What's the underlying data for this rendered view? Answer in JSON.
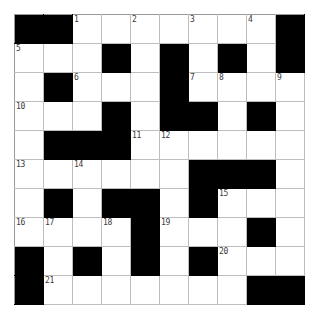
{
  "puzzle": {
    "type": "crossword-grid",
    "rows": 10,
    "columns": 10,
    "cell_size_px": 29,
    "colors": {
      "block": "#000000",
      "cell": "#ffffff",
      "gridline": "#bdbdbd",
      "border": "#8a8a8a",
      "number_text": "#3a3a3a",
      "page_background": "#ffffff"
    },
    "numbered_clue_count": 21,
    "clue_numbers_visible": [
      1,
      2,
      3,
      4,
      5,
      6,
      7,
      8,
      9,
      10,
      11,
      12,
      13,
      14,
      15,
      16,
      17,
      18,
      19,
      20,
      21
    ],
    "grid": [
      [
        {
          "block": true,
          "number": null,
          "letter": ""
        },
        {
          "block": true,
          "number": null,
          "letter": ""
        },
        {
          "block": false,
          "number": "1",
          "letter": ""
        },
        {
          "block": false,
          "number": null,
          "letter": ""
        },
        {
          "block": false,
          "number": "2",
          "letter": ""
        },
        {
          "block": false,
          "number": null,
          "letter": ""
        },
        {
          "block": false,
          "number": "3",
          "letter": ""
        },
        {
          "block": false,
          "number": null,
          "letter": ""
        },
        {
          "block": false,
          "number": "4",
          "letter": ""
        },
        {
          "block": true,
          "number": null,
          "letter": ""
        }
      ],
      [
        {
          "block": false,
          "number": "5",
          "letter": ""
        },
        {
          "block": false,
          "number": null,
          "letter": ""
        },
        {
          "block": false,
          "number": null,
          "letter": ""
        },
        {
          "block": true,
          "number": null,
          "letter": ""
        },
        {
          "block": false,
          "number": null,
          "letter": ""
        },
        {
          "block": true,
          "number": null,
          "letter": ""
        },
        {
          "block": false,
          "number": null,
          "letter": ""
        },
        {
          "block": true,
          "number": null,
          "letter": ""
        },
        {
          "block": false,
          "number": null,
          "letter": ""
        },
        {
          "block": true,
          "number": null,
          "letter": ""
        }
      ],
      [
        {
          "block": false,
          "number": null,
          "letter": ""
        },
        {
          "block": true,
          "number": null,
          "letter": ""
        },
        {
          "block": false,
          "number": "6",
          "letter": ""
        },
        {
          "block": false,
          "number": null,
          "letter": ""
        },
        {
          "block": false,
          "number": null,
          "letter": ""
        },
        {
          "block": true,
          "number": null,
          "letter": ""
        },
        {
          "block": false,
          "number": "7",
          "letter": ""
        },
        {
          "block": false,
          "number": "8",
          "letter": ""
        },
        {
          "block": false,
          "number": null,
          "letter": ""
        },
        {
          "block": false,
          "number": "9",
          "letter": ""
        }
      ],
      [
        {
          "block": false,
          "number": "10",
          "letter": ""
        },
        {
          "block": false,
          "number": null,
          "letter": ""
        },
        {
          "block": false,
          "number": null,
          "letter": ""
        },
        {
          "block": true,
          "number": null,
          "letter": ""
        },
        {
          "block": false,
          "number": null,
          "letter": ""
        },
        {
          "block": true,
          "number": null,
          "letter": ""
        },
        {
          "block": true,
          "number": null,
          "letter": ""
        },
        {
          "block": false,
          "number": null,
          "letter": ""
        },
        {
          "block": true,
          "number": null,
          "letter": ""
        },
        {
          "block": false,
          "number": null,
          "letter": ""
        }
      ],
      [
        {
          "block": false,
          "number": null,
          "letter": ""
        },
        {
          "block": true,
          "number": null,
          "letter": ""
        },
        {
          "block": true,
          "number": null,
          "letter": ""
        },
        {
          "block": true,
          "number": null,
          "letter": ""
        },
        {
          "block": false,
          "number": "11",
          "letter": ""
        },
        {
          "block": false,
          "number": "12",
          "letter": ""
        },
        {
          "block": false,
          "number": null,
          "letter": ""
        },
        {
          "block": false,
          "number": null,
          "letter": ""
        },
        {
          "block": false,
          "number": null,
          "letter": ""
        },
        {
          "block": false,
          "number": null,
          "letter": ""
        }
      ],
      [
        {
          "block": false,
          "number": "13",
          "letter": ""
        },
        {
          "block": false,
          "number": null,
          "letter": ""
        },
        {
          "block": false,
          "number": "14",
          "letter": ""
        },
        {
          "block": false,
          "number": null,
          "letter": ""
        },
        {
          "block": false,
          "number": null,
          "letter": ""
        },
        {
          "block": false,
          "number": null,
          "letter": ""
        },
        {
          "block": true,
          "number": null,
          "letter": ""
        },
        {
          "block": true,
          "number": null,
          "letter": ""
        },
        {
          "block": true,
          "number": null,
          "letter": ""
        },
        {
          "block": false,
          "number": null,
          "letter": ""
        }
      ],
      [
        {
          "block": false,
          "number": null,
          "letter": ""
        },
        {
          "block": true,
          "number": null,
          "letter": ""
        },
        {
          "block": false,
          "number": null,
          "letter": ""
        },
        {
          "block": true,
          "number": null,
          "letter": ""
        },
        {
          "block": true,
          "number": null,
          "letter": ""
        },
        {
          "block": false,
          "number": null,
          "letter": ""
        },
        {
          "block": true,
          "number": null,
          "letter": ""
        },
        {
          "block": false,
          "number": "15",
          "letter": ""
        },
        {
          "block": false,
          "number": null,
          "letter": ""
        },
        {
          "block": false,
          "number": null,
          "letter": ""
        }
      ],
      [
        {
          "block": false,
          "number": "16",
          "letter": ""
        },
        {
          "block": false,
          "number": "17",
          "letter": ""
        },
        {
          "block": false,
          "number": null,
          "letter": ""
        },
        {
          "block": false,
          "number": "18",
          "letter": ""
        },
        {
          "block": true,
          "number": null,
          "letter": ""
        },
        {
          "block": false,
          "number": "19",
          "letter": ""
        },
        {
          "block": false,
          "number": null,
          "letter": ""
        },
        {
          "block": false,
          "number": null,
          "letter": ""
        },
        {
          "block": true,
          "number": null,
          "letter": ""
        },
        {
          "block": false,
          "number": null,
          "letter": ""
        }
      ],
      [
        {
          "block": true,
          "number": null,
          "letter": ""
        },
        {
          "block": false,
          "number": null,
          "letter": ""
        },
        {
          "block": true,
          "number": null,
          "letter": ""
        },
        {
          "block": false,
          "number": null,
          "letter": ""
        },
        {
          "block": true,
          "number": null,
          "letter": ""
        },
        {
          "block": false,
          "number": null,
          "letter": ""
        },
        {
          "block": true,
          "number": null,
          "letter": ""
        },
        {
          "block": false,
          "number": "20",
          "letter": ""
        },
        {
          "block": false,
          "number": null,
          "letter": ""
        },
        {
          "block": false,
          "number": null,
          "letter": ""
        }
      ],
      [
        {
          "block": true,
          "number": null,
          "letter": ""
        },
        {
          "block": false,
          "number": "21",
          "letter": ""
        },
        {
          "block": false,
          "number": null,
          "letter": ""
        },
        {
          "block": false,
          "number": null,
          "letter": ""
        },
        {
          "block": false,
          "number": null,
          "letter": ""
        },
        {
          "block": false,
          "number": null,
          "letter": ""
        },
        {
          "block": false,
          "number": null,
          "letter": ""
        },
        {
          "block": false,
          "number": null,
          "letter": ""
        },
        {
          "block": true,
          "number": null,
          "letter": ""
        },
        {
          "block": true,
          "number": null,
          "letter": ""
        }
      ]
    ]
  }
}
